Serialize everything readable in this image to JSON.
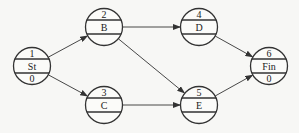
{
  "diagram": {
    "type": "activity-network",
    "colors": {
      "line": "#333333",
      "background": "#f7f7f5",
      "text": "#222222"
    },
    "nodes": [
      {
        "id": "n1",
        "top": "1",
        "label": "St",
        "bottom": "0",
        "cx": 32,
        "cy": 66
      },
      {
        "id": "n2",
        "top": "2",
        "label": "B",
        "bottom": "",
        "cx": 104,
        "cy": 27
      },
      {
        "id": "n3",
        "top": "3",
        "label": "C",
        "bottom": "",
        "cx": 104,
        "cy": 105
      },
      {
        "id": "n4",
        "top": "4",
        "label": "D",
        "bottom": "",
        "cx": 199,
        "cy": 27
      },
      {
        "id": "n5",
        "top": "5",
        "label": "E",
        "bottom": "",
        "cx": 199,
        "cy": 105
      },
      {
        "id": "n6",
        "top": "6",
        "label": "Fin",
        "bottom": "0",
        "cx": 269,
        "cy": 66
      }
    ],
    "edges": [
      {
        "from": "n1",
        "to": "n2"
      },
      {
        "from": "n1",
        "to": "n3"
      },
      {
        "from": "n2",
        "to": "n4"
      },
      {
        "from": "n2",
        "to": "n5"
      },
      {
        "from": "n3",
        "to": "n5"
      },
      {
        "from": "n4",
        "to": "n6"
      },
      {
        "from": "n5",
        "to": "n6"
      }
    ],
    "radius": 18.5
  }
}
